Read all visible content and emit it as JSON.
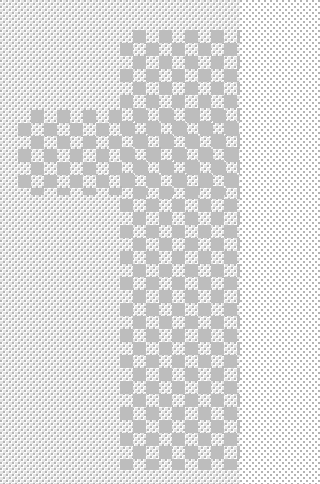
{
  "pattern": {
    "description": "Decorative checkerboard / dither pattern",
    "colors": {
      "background": "#ffffff",
      "dither": "#cfcfcf",
      "checker": "#bdbdbd"
    },
    "regions": [
      {
        "name": "vertical-band",
        "x": 120,
        "y": 30,
        "width": 120,
        "height": 440
      },
      {
        "name": "horizontal-band",
        "x": 18,
        "y": 110,
        "width": 222,
        "height": 85
      }
    ]
  }
}
